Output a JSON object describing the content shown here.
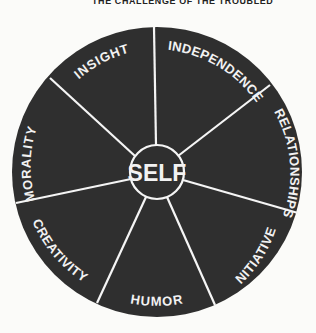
{
  "header": {
    "title": "THE CHALLENGE OF THE TROUBLED"
  },
  "wheel": {
    "center_label": "SELF",
    "colors": {
      "fill": "#2f2f2f",
      "lines": "#f5f5f5",
      "text": "#f2f2f2"
    },
    "segments": [
      {
        "label": "INDEPENDENCE"
      },
      {
        "label": "RELATIONSHIPS"
      },
      {
        "label": "INITIATIVE"
      },
      {
        "label": "HUMOR"
      },
      {
        "label": "CREATIVITY"
      },
      {
        "label": "MORALITY"
      },
      {
        "label": "INSIGHT"
      }
    ]
  }
}
